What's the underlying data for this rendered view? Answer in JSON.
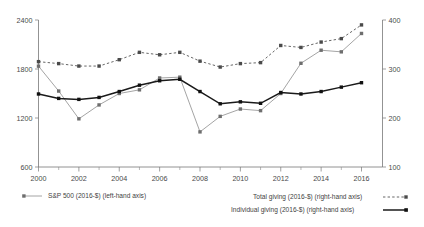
{
  "chart_data": {
    "type": "line",
    "title": "",
    "subtitle": "",
    "xlabel": "",
    "ylabel": "",
    "x": [
      2000,
      2001,
      2002,
      2003,
      2004,
      2005,
      2006,
      2007,
      2008,
      2009,
      2010,
      2011,
      2012,
      2013,
      2014,
      2015,
      2016
    ],
    "x_tick_labels": [
      "2000",
      "2002",
      "2004",
      "2006",
      "2008",
      "2010",
      "2012",
      "2014",
      "2016"
    ],
    "left_axis": {
      "label": "S&P 500 (2016-$)",
      "ticks": [
        600,
        1200,
        1800,
        2400
      ],
      "tick_labels": [
        "600",
        "1200",
        "1800",
        "2400"
      ],
      "ylim": [
        600,
        2400
      ]
    },
    "right_axis": {
      "label": "Giving (2016-$, billions)",
      "ticks": [
        100,
        200,
        300,
        400
      ],
      "tick_labels": [
        "100",
        "200",
        "300",
        "400"
      ],
      "ylim": [
        100,
        400
      ]
    },
    "grid": false,
    "legend_position": "below",
    "series": [
      {
        "name": "S&P 500 (2016-$) (left-hand axis)",
        "axis": "left",
        "color": "#9a9a9a",
        "style": "solid",
        "marker": "square",
        "values": [
          1835,
          1530,
          1190,
          1360,
          1500,
          1545,
          1690,
          1700,
          1030,
          1220,
          1310,
          1290,
          1500,
          1870,
          2030,
          2010,
          2235
        ]
      },
      {
        "name": "Total giving (2016-$) (right-hand axis)",
        "axis": "right",
        "color": "#555555",
        "style": "dashed",
        "marker": "square",
        "values": [
          315,
          311,
          306,
          306,
          319,
          334,
          329,
          334,
          316,
          304,
          311,
          313,
          348,
          344,
          355,
          362,
          390
        ]
      },
      {
        "name": "Individual giving (2016-$) (right-hand axis)",
        "axis": "right",
        "color": "#1a1a1a",
        "style": "solid",
        "marker": "square",
        "values": [
          249,
          240,
          238,
          242,
          254,
          267,
          276,
          279,
          254,
          229,
          233,
          230,
          252,
          249,
          254,
          263,
          272
        ]
      }
    ]
  },
  "legend": {
    "items": [
      {
        "label": "S&P 500 (2016-$) (left-hand axis)",
        "marker_side": "left",
        "style": "solid",
        "color": "#9a9a9a"
      },
      {
        "label": "Total giving (2016-$) (right-hand axis)",
        "marker_side": "right",
        "style": "dashed",
        "color": "#555555"
      },
      {
        "label": "Individual giving (2016-$) (right-hand axis)",
        "marker_side": "right",
        "style": "solid",
        "color": "#1a1a1a"
      }
    ]
  }
}
